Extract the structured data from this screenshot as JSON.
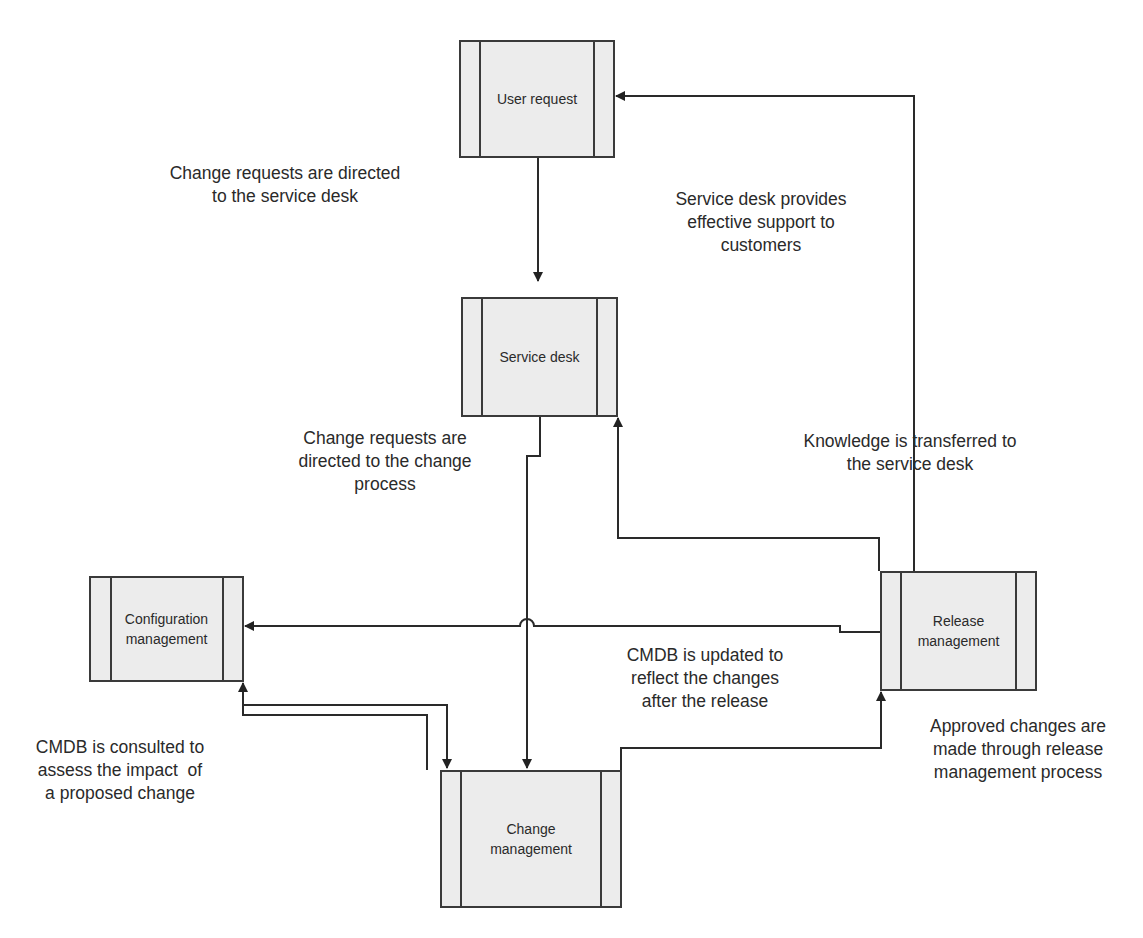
{
  "diagram": {
    "nodes": {
      "user_request": {
        "label": "User request"
      },
      "service_desk": {
        "label": "Service desk"
      },
      "configuration_management": {
        "label": "Configuration management"
      },
      "release_management": {
        "label": "Release management"
      },
      "change_management": {
        "label": "Change management"
      }
    },
    "annotations": {
      "to_service_desk": "Change requests are directed to the service desk",
      "support_customers": "Service desk provides effective support to customers",
      "to_change_process": "Change requests are directed to the change process",
      "knowledge_transfer": "Knowledge is transferred to the service desk",
      "cmdb_updated": "CMDB is updated to reflect the changes after the release",
      "cmdb_consulted": "CMDB is consulted to assess the impact  of a proposed change",
      "approved_changes": "Approved changes are made through release management process"
    },
    "annotation_lines": {
      "to_service_desk": [
        "Change requests are directed",
        "to the service desk"
      ],
      "support_customers": [
        "Service desk provides",
        "effective support to",
        "customers"
      ],
      "to_change_process": [
        "Change requests are",
        "directed to the change",
        "process"
      ],
      "knowledge_transfer": [
        "Knowledge is transferred to",
        "the service desk"
      ],
      "cmdb_updated": [
        "CMDB is updated to",
        "reflect the changes",
        "after the release"
      ],
      "cmdb_consulted": [
        "CMDB is consulted to",
        "assess the impact  of",
        "a proposed change"
      ],
      "approved_changes": [
        "Approved changes are",
        "made through release",
        "management process"
      ]
    },
    "edges": [
      {
        "from": "User request",
        "to": "Service desk"
      },
      {
        "from": "Release management",
        "to": "User request"
      },
      {
        "from": "Service desk",
        "to": "Change management"
      },
      {
        "from": "Release management",
        "to": "Service desk"
      },
      {
        "from": "Release management",
        "to": "Configuration management"
      },
      {
        "from": "Change management",
        "to": "Configuration management"
      },
      {
        "from": "Configuration management",
        "to": "Change management"
      },
      {
        "from": "Change management",
        "to": "Release management"
      }
    ],
    "colors": {
      "line": "#2a2a2a",
      "box_fill": "#ececec",
      "box_border": "#3a3a3a"
    }
  }
}
